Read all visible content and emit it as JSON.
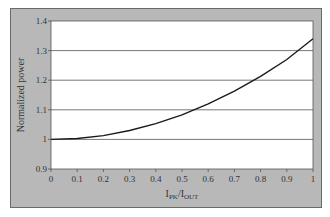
{
  "chart_data": {
    "type": "line",
    "title": "",
    "xlabel": "I_PK/I_OUT",
    "xlabel_main": "I",
    "xlabel_sub1": "PK",
    "xlabel_mid": "/I",
    "xlabel_sub2": "OUT",
    "ylabel": "Normalized power",
    "xlim": [
      0,
      1
    ],
    "ylim": [
      0.9,
      1.4
    ],
    "x_ticks": [
      "0",
      "0.1",
      "0.2",
      "0.3",
      "0.4",
      "0.5",
      "0.6",
      "0.7",
      "0.8",
      "0.9",
      "1"
    ],
    "y_ticks": [
      "0.9",
      "1",
      "1.1",
      "1.2",
      "1.3",
      "1.4"
    ],
    "grid": "horizontal",
    "legend": "none",
    "series": [
      {
        "name": "Normalized power",
        "x": [
          0,
          0.1,
          0.2,
          0.3,
          0.4,
          0.5,
          0.6,
          0.7,
          0.8,
          0.9,
          1.0
        ],
        "values": [
          1.0,
          1.003,
          1.013,
          1.03,
          1.053,
          1.083,
          1.12,
          1.163,
          1.213,
          1.27,
          1.34
        ]
      }
    ],
    "colors": {
      "frame": "#b8b8b8",
      "plot_bg": "#ffffff",
      "line": "#1a1a1a",
      "grid": "#555555"
    }
  }
}
